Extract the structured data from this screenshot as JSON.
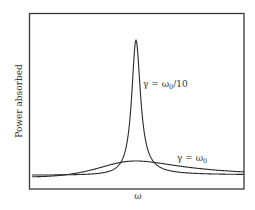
{
  "chart_data": {
    "type": "line",
    "title": "",
    "xlabel": "ω",
    "ylabel": "Power absorbed",
    "grid": false,
    "legend": null,
    "xlim": [
      0,
      2
    ],
    "ylim": [
      0,
      1
    ],
    "x_center_label": "ω0",
    "series": [
      {
        "name": "γ = ω0/10",
        "gamma_over_omega0": 0.1,
        "description": "sharp resonance peak centered at ω0",
        "peak_relative_height": 0.85,
        "baseline_relative_height": 0.08
      },
      {
        "name": "γ = ω0",
        "gamma_over_omega0": 1.0,
        "description": "broad, low resonance centered at ω0",
        "peak_relative_height": 0.16,
        "baseline_relative_height": 0.07
      }
    ],
    "annotations": [
      {
        "text": "γ = ω0/10",
        "position": "right of sharp peak, mid-height"
      },
      {
        "text": "γ = ω0",
        "position": "above broad curve, right side"
      }
    ]
  },
  "labels": {
    "x_axis": "ω",
    "y_axis": "Power absorbed",
    "sharp_gamma": "γ = ω",
    "sharp_sub": "0",
    "sharp_tail": "/10",
    "broad_gamma": "γ = ω",
    "broad_sub": "0"
  },
  "colors": {
    "frame": "#333333",
    "curve": "#2a2a2a",
    "text": "#333333"
  }
}
